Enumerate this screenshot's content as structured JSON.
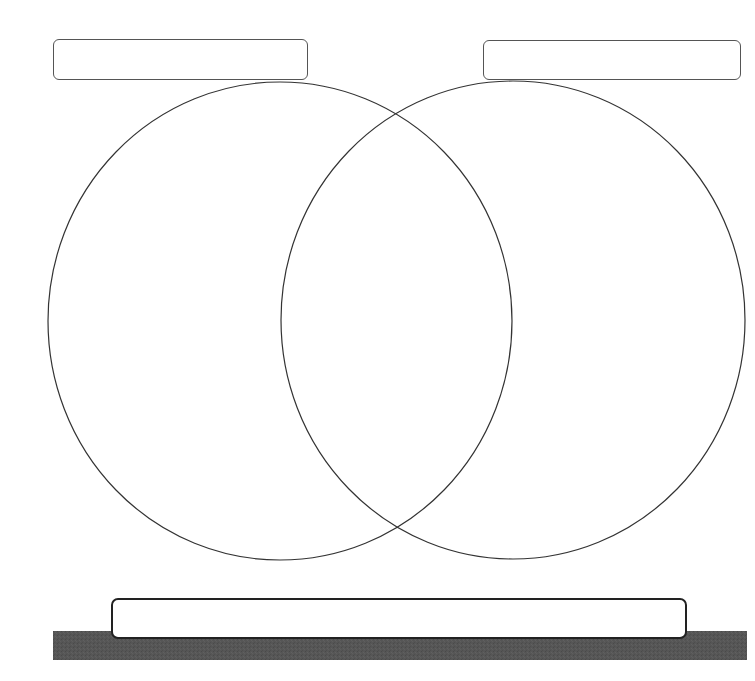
{
  "diagram": {
    "type": "venn",
    "title": "",
    "left_set": {
      "label": "",
      "shape": {
        "cx": 280,
        "cy": 321,
        "rx": 232,
        "ry": 239
      }
    },
    "right_set": {
      "label": "",
      "shape": {
        "cx": 513,
        "cy": 320,
        "rx": 232,
        "ry": 239
      }
    },
    "bottom_label": "",
    "colors": {
      "stroke": "#333333",
      "box_border": "#555555",
      "base_bar": "#565656",
      "background": "#ffffff"
    }
  }
}
